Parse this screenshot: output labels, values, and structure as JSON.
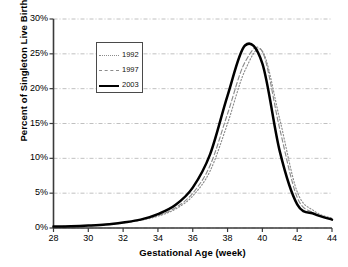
{
  "chart_data": {
    "type": "line",
    "title": "",
    "xlabel": "Gestational Age (week)",
    "ylabel": "Percent of Singleton Live Births (%)",
    "xlim": [
      28,
      44
    ],
    "ylim": [
      0,
      30
    ],
    "xticks": [
      "28",
      "30",
      "32",
      "34",
      "36",
      "38",
      "40",
      "42",
      "44"
    ],
    "xtick_values": [
      28,
      30,
      32,
      34,
      36,
      38,
      40,
      42,
      44
    ],
    "yticks": [
      "0%",
      "5%",
      "10%",
      "15%",
      "20%",
      "25%",
      "30%"
    ],
    "ytick_values": [
      0,
      5,
      10,
      15,
      20,
      25,
      30
    ],
    "grid": "horizontal",
    "legend_position": "upper-left",
    "x": [
      28,
      29,
      30,
      31,
      32,
      33,
      34,
      35,
      36,
      37,
      38,
      39,
      40,
      41,
      42,
      43,
      44
    ],
    "series": [
      {
        "name": "1992",
        "style": "dotted",
        "color": "#8c8c8c",
        "values": [
          0.2,
          0.25,
          0.35,
          0.5,
          0.75,
          1.1,
          1.7,
          2.7,
          4.6,
          8.2,
          15.0,
          22.6,
          25.4,
          15.6,
          5.2,
          2.4,
          1.4
        ]
      },
      {
        "name": "1997",
        "style": "dashed",
        "color": "#8c8c8c",
        "values": [
          0.2,
          0.25,
          0.35,
          0.5,
          0.75,
          1.15,
          1.8,
          2.9,
          5.0,
          9.0,
          16.4,
          23.8,
          25.3,
          14.2,
          4.4,
          2.1,
          1.3
        ]
      },
      {
        "name": "2003",
        "style": "solid",
        "color": "#000000",
        "values": [
          0.2,
          0.25,
          0.35,
          0.5,
          0.8,
          1.2,
          2.0,
          3.3,
          5.8,
          10.6,
          19.0,
          26.2,
          23.6,
          11.0,
          3.4,
          2.0,
          1.2
        ]
      }
    ]
  },
  "legend": {
    "entries": [
      {
        "label": "1992"
      },
      {
        "label": "1997"
      },
      {
        "label": "2003"
      }
    ]
  }
}
